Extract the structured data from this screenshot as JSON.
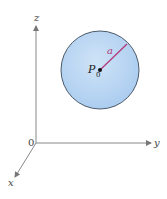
{
  "diagram": {
    "type": "3d-axes-with-sphere",
    "axes": {
      "origin_label": "0",
      "x_label": "x",
      "y_label": "y",
      "z_label": "z",
      "color": "#777777"
    },
    "sphere": {
      "center_label": "P",
      "center_subscript": "0",
      "radius_label": "a",
      "fill_color": "#b9d6f2",
      "edge_color": "#4a5a6a",
      "radius_color": "#b03a7a"
    }
  }
}
